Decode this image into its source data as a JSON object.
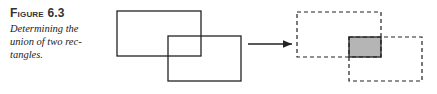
{
  "figure": {
    "label": "Figure 6.3",
    "caption_lines": [
      "Determining the",
      "union of two rec-",
      "tangles."
    ]
  },
  "diagram": {
    "left": {
      "rect_a": {
        "x": 117,
        "y": 11,
        "w": 84,
        "h": 45
      },
      "rect_b": {
        "x": 168,
        "y": 36,
        "w": 73,
        "h": 45
      }
    },
    "arrow": {
      "x1": 248,
      "x2": 292,
      "y": 44
    },
    "right": {
      "rect_a": {
        "x": 297,
        "y": 12,
        "w": 84,
        "h": 45,
        "style": "dashed"
      },
      "rect_b": {
        "x": 349,
        "y": 37,
        "w": 73,
        "h": 44,
        "style": "dashed"
      },
      "overlap": {
        "x": 349,
        "y": 37,
        "w": 32,
        "h": 20,
        "fill": "#b5b5b5"
      }
    }
  }
}
